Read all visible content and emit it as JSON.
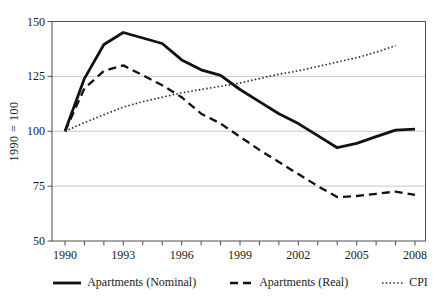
{
  "figure": {
    "y_axis_title": "1990 = 100"
  },
  "chart_data": {
    "type": "line",
    "title": "",
    "xlabel": "",
    "ylabel": "1990 = 100",
    "ylim": [
      50,
      150
    ],
    "x_range": [
      1990,
      2008
    ],
    "y_ticks": [
      "150",
      "125",
      "100",
      "75",
      "50"
    ],
    "gridline_values": [
      125,
      100,
      75
    ],
    "x_labels": [
      "1990",
      "1993",
      "1996",
      "1999",
      "2002",
      "2005",
      "2008"
    ],
    "grid": "horizontal",
    "legend_position": "bottom",
    "colors": {
      "line": "#111111",
      "gridline": "#c8c8c8",
      "axis": "#4d4d4d",
      "text": "#1a1a1a"
    },
    "x_start_year": 1990,
    "series": [
      {
        "name": "Apartments (Nominal)",
        "style": "solid",
        "color": "#111111",
        "values": [
          100,
          124,
          139.5,
          145,
          142.5,
          140,
          132.5,
          128,
          125.5,
          119,
          113.5,
          108,
          103.5,
          98,
          92.5,
          94.5,
          97.5,
          100.5,
          101
        ]
      },
      {
        "name": "Apartments (Real)",
        "style": "dashed",
        "color": "#111111",
        "values": [
          100,
          119.5,
          127.5,
          130,
          125.5,
          121,
          115.5,
          108,
          103.5,
          97.5,
          91.5,
          86,
          80.5,
          75,
          70,
          70.5,
          71.5,
          72.5,
          71
        ]
      },
      {
        "name": "CPI",
        "style": "dotted",
        "color": "#222222",
        "values": [
          100,
          104,
          107.5,
          111,
          113.5,
          115.5,
          117.5,
          119,
          120.5,
          122,
          124,
          126,
          127.5,
          129.5,
          131.5,
          133.5,
          136,
          139
        ]
      }
    ]
  }
}
